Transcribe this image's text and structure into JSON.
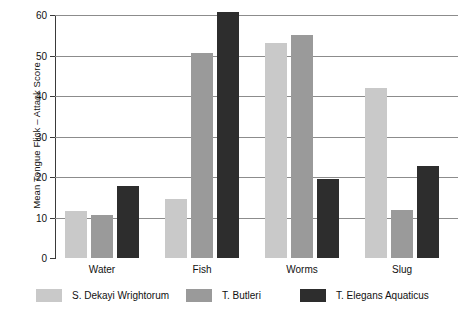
{
  "chart_data": {
    "type": "bar",
    "title": "",
    "xlabel": "",
    "ylabel": "Mean Tongue Flick – Attack Score",
    "categories": [
      "Water",
      "Fish",
      "Worms",
      "Slug"
    ],
    "ylim": [
      0,
      60
    ],
    "yticks": [
      0,
      10,
      20,
      30,
      40,
      50,
      60
    ],
    "ytick_labels": [
      "0",
      "10",
      "20",
      "30",
      "40",
      "50",
      "60"
    ],
    "grid": true,
    "legend_position": "bottom",
    "series": [
      {
        "name": "S. Dekayi Wrightorum",
        "color": "#c9c9c9",
        "values": [
          11.7,
          14.5,
          53.0,
          42.0
        ]
      },
      {
        "name": "T. Butleri",
        "color": "#9a9a9a",
        "values": [
          10.6,
          50.5,
          55.0,
          11.8
        ]
      },
      {
        "name": "T. Elegans Aquaticus",
        "color": "#2d2d2d",
        "values": [
          17.7,
          60.7,
          19.5,
          22.7
        ]
      }
    ]
  },
  "axis": {
    "line_color": "#3a3a3a",
    "grid_color": "#8c8c8c"
  }
}
